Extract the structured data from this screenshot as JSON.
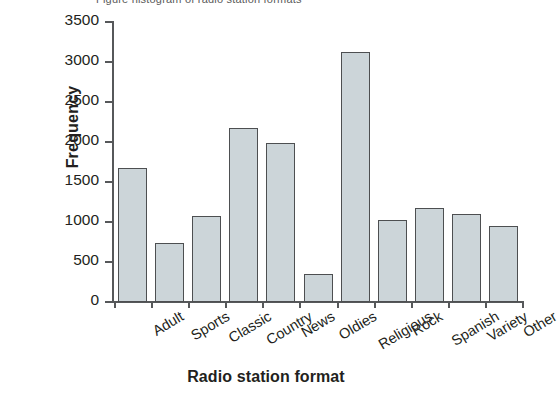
{
  "figure": {
    "top_caption_remnant": "Figure  histogram of radio station formats"
  },
  "chart_data": {
    "type": "bar",
    "title": "",
    "subtitle": "",
    "xlabel": "Radio station format",
    "ylabel": "Frequency",
    "categories": [
      "Adult",
      "Sports",
      "Classic",
      "Country",
      "News",
      "Oldies",
      "Religious",
      "Rock",
      "Spanish",
      "Variety",
      "Other"
    ],
    "values": [
      1670,
      740,
      1070,
      2170,
      1990,
      350,
      3130,
      1020,
      1170,
      1100,
      950
    ],
    "ylim": [
      0,
      3500
    ],
    "ytick_values": [
      0,
      500,
      1000,
      1500,
      2000,
      2500,
      3000,
      3500
    ],
    "ytick_labels": [
      "0",
      "500",
      "1000",
      "1500",
      "2000",
      "2500",
      "3000",
      "3500"
    ],
    "grid": false,
    "legend": null,
    "legend_position": "none",
    "bar_fill_color": "#ccd5d9",
    "bar_edge_color": "#4d4f51",
    "axis_color": "#56585a",
    "text_color": "#231f20",
    "background_color": "#ffffff",
    "xlabel_rotation_deg": -31
  }
}
